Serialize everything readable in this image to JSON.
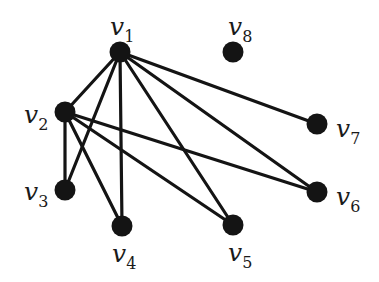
{
  "graph": {
    "node_color": "#141414",
    "edge_color": "#141414",
    "background": "#ffffff",
    "nodes": [
      {
        "id": "v1",
        "name": "v",
        "sub": "1",
        "x": 120,
        "y": 52,
        "lx": 110,
        "ly": 35
      },
      {
        "id": "v2",
        "name": "v",
        "sub": "2",
        "x": 65,
        "y": 112,
        "lx": 24,
        "ly": 123
      },
      {
        "id": "v3",
        "name": "v",
        "sub": "3",
        "x": 65,
        "y": 190,
        "lx": 24,
        "ly": 200
      },
      {
        "id": "v4",
        "name": "v",
        "sub": "4",
        "x": 122,
        "y": 226,
        "lx": 112,
        "ly": 262
      },
      {
        "id": "v5",
        "name": "v",
        "sub": "5",
        "x": 233,
        "y": 225,
        "lx": 228,
        "ly": 261
      },
      {
        "id": "v6",
        "name": "v",
        "sub": "6",
        "x": 317,
        "y": 192,
        "lx": 336,
        "ly": 205
      },
      {
        "id": "v7",
        "name": "v",
        "sub": "7",
        "x": 317,
        "y": 124,
        "lx": 336,
        "ly": 137
      },
      {
        "id": "v8",
        "name": "v",
        "sub": "8",
        "x": 233,
        "y": 52,
        "lx": 228,
        "ly": 35
      }
    ],
    "edges": [
      [
        "v1",
        "v2"
      ],
      [
        "v1",
        "v3"
      ],
      [
        "v1",
        "v4"
      ],
      [
        "v1",
        "v5"
      ],
      [
        "v1",
        "v6"
      ],
      [
        "v1",
        "v7"
      ],
      [
        "v2",
        "v3"
      ],
      [
        "v2",
        "v4"
      ],
      [
        "v2",
        "v5"
      ],
      [
        "v2",
        "v6"
      ]
    ]
  }
}
